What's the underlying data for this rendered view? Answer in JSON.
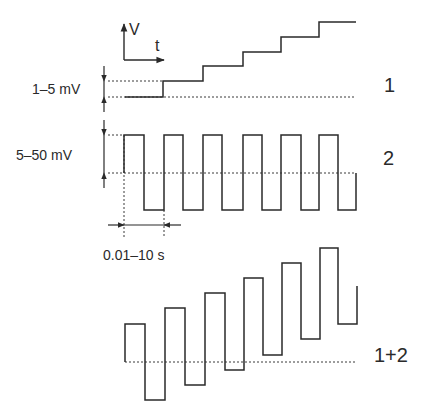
{
  "axes_icon": {
    "y_label": "V",
    "x_label": "t"
  },
  "labels": {
    "amp1": "1–5 mV",
    "amp2": "5–50 mV",
    "period": "0.01–10 s",
    "trace1": "1",
    "trace2": "2",
    "trace3": "1+2"
  },
  "colors": {
    "line": "#2a2a2a",
    "dotted": "#3a3a3a",
    "background": "#ffffff"
  },
  "traces": [
    {
      "name": "staircase",
      "points": "125,97 163,97 163,81 203,81 203,66 243,66 243,52 281,52 281,37 319,37 319,22 356,22"
    },
    {
      "name": "square-wave",
      "points": "124,173 124,135 144,135 144,210 164,210 164,135 183,135 183,210 203,210 203,135 222,135 222,210 243,210 243,135 262,135 262,210 281,210 281,135 301,135 301,210 319,210 319,135 338,135 338,210 356,210 356,173"
    },
    {
      "name": "sum-wave",
      "points": "125,362 125,324 145,324 145,400 165,400 165,308 185,308 185,385 205,385 205,293 225,293 225,370 244,370 244,278 263,278 263,355 282,355 282,263 301,263 301,339 320,339 320,248 338,248 338,324 357,324 357,286"
    }
  ]
}
